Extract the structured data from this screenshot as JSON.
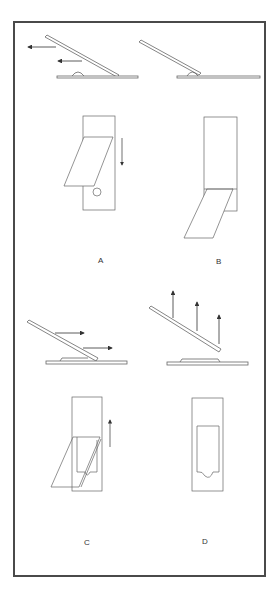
{
  "figure": {
    "panels": [
      {
        "id": "A",
        "label": "A",
        "side_view": "spreader slide tilted at an angle, pulled back toward the drop of blood",
        "top_view": "spreader slide drawn back toward drop",
        "arrows": [
          "left",
          "left",
          "down"
        ]
      },
      {
        "id": "B",
        "label": "B",
        "side_view": "spreader contacts the drop, blood spreads along edge",
        "top_view": "drop spreads along edge of spreader"
      },
      {
        "id": "C",
        "label": "C",
        "side_view": "spreader pushed forward to spread the blood",
        "top_view": "spreader pushed along slide",
        "arrows": [
          "right",
          "right",
          "up"
        ]
      },
      {
        "id": "D",
        "label": "D",
        "side_view": "spreader lifted off the slide",
        "top_view": "finished smear with feathered edge",
        "arrows": [
          "up",
          "up",
          "up"
        ]
      }
    ]
  },
  "colors": {
    "line": "#555555",
    "frame": "#4a4a4a",
    "background": "#ffffff"
  }
}
